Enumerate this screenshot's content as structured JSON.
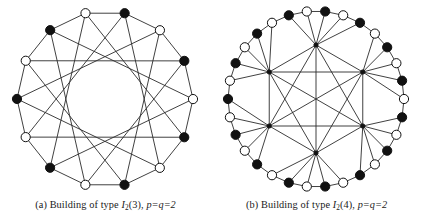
{
  "figure": {
    "panels": [
      {
        "id": "panel-a",
        "caption": {
          "label": "(a)",
          "text": "Building of type",
          "type_symbol": "I",
          "type_sub": "2",
          "type_arg": "(3),",
          "params": "p=q=2",
          "full": "(a) Building of type I2(3), p=q=2"
        },
        "graph": {
          "type": "incidence-graph",
          "description": "Incidence graph of the projective plane of order 2 (Heawood graph) drawn as a 14-cycle with chords",
          "rim_vertex_count": 14,
          "hub_vertex_count": 0,
          "vertex_colors": [
            "black",
            "white"
          ],
          "color_pattern": "alternating",
          "center": [
            105,
            99
          ],
          "radius": 88,
          "start_angle_deg": -77.1,
          "chord_steps": [
            5
          ],
          "rim_edges": true,
          "vertices": [
            {
              "index": 0,
              "fill": "black"
            },
            {
              "index": 1,
              "fill": "white"
            },
            {
              "index": 2,
              "fill": "black"
            },
            {
              "index": 3,
              "fill": "white"
            },
            {
              "index": 4,
              "fill": "black"
            },
            {
              "index": 5,
              "fill": "white"
            },
            {
              "index": 6,
              "fill": "black"
            },
            {
              "index": 7,
              "fill": "white"
            },
            {
              "index": 8,
              "fill": "black"
            },
            {
              "index": 9,
              "fill": "white"
            },
            {
              "index": 10,
              "fill": "black"
            },
            {
              "index": 11,
              "fill": "white"
            },
            {
              "index": 12,
              "fill": "black"
            },
            {
              "index": 13,
              "fill": "white"
            }
          ]
        }
      },
      {
        "id": "panel-b",
        "caption": {
          "label": "(b)",
          "text": "Building of type",
          "type_symbol": "I",
          "type_sub": "2",
          "type_arg": "(4),",
          "params": "p=q=2",
          "full": "(b) Building of type I2(4), p=q=2"
        },
        "graph": {
          "type": "incidence-graph",
          "description": "Incidence graph of the generalized quadrangle of order (2,2) drawn as a 30-cycle rim with 6 interior hub vertices",
          "rim_vertex_count": 30,
          "hub_vertex_count": 6,
          "vertex_colors": [
            "black",
            "white"
          ],
          "color_pattern": "alternating",
          "center": [
            105,
            99
          ],
          "radius": 88,
          "hub_radius": 54,
          "start_angle_deg": -84,
          "hub_start_angle_deg": -90,
          "rim_edges": true,
          "hub_polygon_edges": true,
          "spokes_per_hub": 5,
          "vertices": [
            {
              "index": 0,
              "fill": "black"
            },
            {
              "index": 1,
              "fill": "white"
            },
            {
              "index": 2,
              "fill": "black"
            },
            {
              "index": 3,
              "fill": "white"
            },
            {
              "index": 4,
              "fill": "black"
            },
            {
              "index": 5,
              "fill": "white"
            },
            {
              "index": 6,
              "fill": "black"
            },
            {
              "index": 7,
              "fill": "white"
            },
            {
              "index": 8,
              "fill": "black"
            },
            {
              "index": 9,
              "fill": "white"
            },
            {
              "index": 10,
              "fill": "black"
            },
            {
              "index": 11,
              "fill": "white"
            },
            {
              "index": 12,
              "fill": "black"
            },
            {
              "index": 13,
              "fill": "white"
            },
            {
              "index": 14,
              "fill": "black"
            },
            {
              "index": 15,
              "fill": "white"
            },
            {
              "index": 16,
              "fill": "black"
            },
            {
              "index": 17,
              "fill": "white"
            },
            {
              "index": 18,
              "fill": "black"
            },
            {
              "index": 19,
              "fill": "white"
            },
            {
              "index": 20,
              "fill": "black"
            },
            {
              "index": 21,
              "fill": "white"
            },
            {
              "index": 22,
              "fill": "black"
            },
            {
              "index": 23,
              "fill": "white"
            },
            {
              "index": 24,
              "fill": "black"
            },
            {
              "index": 25,
              "fill": "white"
            },
            {
              "index": 26,
              "fill": "black"
            },
            {
              "index": 27,
              "fill": "white"
            },
            {
              "index": 28,
              "fill": "black"
            },
            {
              "index": 29,
              "fill": "white"
            }
          ]
        }
      }
    ],
    "style": {
      "edge_color": "#2b2b2b",
      "edge_width": 0.9,
      "vertex_fill_black": "#111111",
      "vertex_fill_white": "#ffffff",
      "vertex_stroke": "#111111",
      "vertex_radius": 4.6,
      "hub_radius_px": 2.1,
      "background": "#ffffff"
    }
  }
}
